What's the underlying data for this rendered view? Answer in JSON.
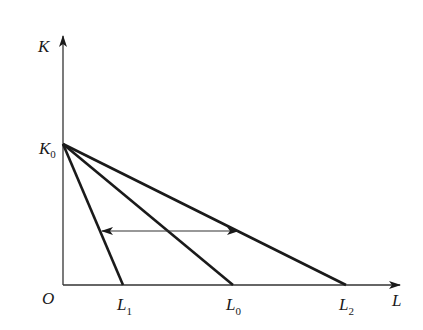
{
  "diagram": {
    "type": "isocost-lines",
    "axes": {
      "y_label": "K",
      "x_label": "L",
      "origin_label": "O"
    },
    "intercepts": {
      "k0": {
        "main": "K",
        "sub": "0"
      },
      "l1": {
        "main": "L",
        "sub": "1"
      },
      "l0": {
        "main": "L",
        "sub": "0"
      },
      "l2": {
        "main": "L",
        "sub": "2"
      }
    },
    "lines": [
      {
        "name": "K0-L1",
        "from": "K0",
        "to": "L1"
      },
      {
        "name": "K0-L0",
        "from": "K0",
        "to": "L0"
      },
      {
        "name": "K0-L2",
        "from": "K0",
        "to": "L2"
      }
    ],
    "double_arrow": {
      "description": "rotation between L1 and L2 budget lines"
    },
    "colors": {
      "line": "#1a1a1a",
      "axis": "#333333",
      "background": "#ffffff"
    }
  }
}
